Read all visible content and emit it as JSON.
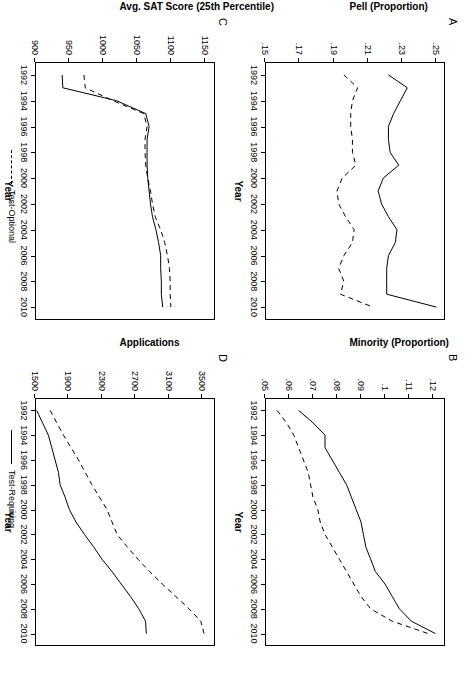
{
  "figure": {
    "panels": [
      "A",
      "B",
      "C",
      "D"
    ],
    "xlabel": "Year",
    "x_ticks": [
      "1992",
      "1994",
      "1996",
      "1998",
      "2000",
      "2002",
      "2004",
      "2006",
      "2008",
      "2010"
    ],
    "xlim": [
      1991,
      2011
    ],
    "legend": [
      {
        "label": "Test-Optional",
        "style": "dashed"
      },
      {
        "label": "Test-Requiring",
        "style": "solid"
      }
    ],
    "line_color": "#000000"
  },
  "chart_data": [
    {
      "type": "line",
      "panel": "A",
      "title": "A",
      "xlabel": "Year",
      "ylabel": "Pell (Proportion)",
      "xlim": [
        1991,
        2011
      ],
      "ylim": [
        0.15,
        0.255
      ],
      "y_ticks": [
        0.25,
        0.23,
        0.21,
        0.19,
        0.17,
        0.15
      ],
      "y_tick_labels": [
        ".25",
        ".23",
        ".21",
        ".19",
        ".17",
        ".15"
      ],
      "x": [
        1992,
        1993,
        1994,
        1995,
        1996,
        1997,
        1998,
        1999,
        2000,
        2001,
        2002,
        2003,
        2004,
        2005,
        2006,
        2007,
        2008,
        2009,
        2010
      ],
      "grid": false,
      "legend_position": "below-figure",
      "series": [
        {
          "name": "Test-Requiring",
          "style": "solid",
          "values": [
            0.222,
            0.233,
            0.229,
            0.225,
            0.222,
            0.222,
            0.223,
            0.228,
            0.219,
            0.216,
            0.218,
            0.222,
            0.227,
            0.226,
            0.222,
            0.221,
            0.221,
            0.221,
            0.25
          ]
        },
        {
          "name": "Test-Optional",
          "style": "dashed",
          "values": [
            0.196,
            0.204,
            0.201,
            0.2,
            0.2,
            0.201,
            0.201,
            0.203,
            0.195,
            0.192,
            0.193,
            0.197,
            0.202,
            0.201,
            0.196,
            0.193,
            0.196,
            0.194,
            0.213
          ]
        }
      ]
    },
    {
      "type": "line",
      "panel": "B",
      "title": "B",
      "xlabel": "Year",
      "ylabel": "Minority (Proportion)",
      "xlim": [
        1991,
        2011
      ],
      "ylim": [
        0.05,
        0.125
      ],
      "y_ticks": [
        0.12,
        0.11,
        0.1,
        0.09,
        0.08,
        0.07,
        0.06,
        0.05
      ],
      "y_tick_labels": [
        ".12",
        ".11",
        ".1",
        ".09",
        ".08",
        ".07",
        ".06",
        ".05"
      ],
      "x": [
        1992,
        1993,
        1994,
        1995,
        1996,
        1997,
        1998,
        1999,
        2000,
        2001,
        2002,
        2003,
        2004,
        2005,
        2006,
        2007,
        2008,
        2009,
        2010
      ],
      "grid": false,
      "legend_position": "below-figure",
      "series": [
        {
          "name": "Test-Requiring",
          "style": "solid",
          "values": [
            0.064,
            0.07,
            0.075,
            0.075,
            0.078,
            0.081,
            0.084,
            0.086,
            0.088,
            0.09,
            0.091,
            0.092,
            0.094,
            0.096,
            0.1,
            0.103,
            0.106,
            0.111,
            0.121
          ]
        },
        {
          "name": "Test-Optional",
          "style": "dashed",
          "values": [
            0.055,
            0.059,
            0.062,
            0.064,
            0.066,
            0.068,
            0.069,
            0.07,
            0.072,
            0.073,
            0.075,
            0.078,
            0.081,
            0.084,
            0.087,
            0.09,
            0.094,
            0.103,
            0.118
          ]
        }
      ]
    },
    {
      "type": "line",
      "panel": "C",
      "title": "C",
      "xlabel": "Year",
      "ylabel": "Avg. SAT Score (25th Percentile)",
      "xlim": [
        1991,
        2011
      ],
      "ylim": [
        900,
        1165
      ],
      "y_ticks": [
        1150,
        1100,
        1050,
        1000,
        950,
        900
      ],
      "y_tick_labels": [
        "1150",
        "1100",
        "1050",
        "1000",
        "950",
        "900"
      ],
      "x": [
        1992,
        1993,
        1994,
        1995,
        1996,
        1997,
        1998,
        1999,
        2000,
        2001,
        2002,
        2003,
        2004,
        2005,
        2006,
        2007,
        2008,
        2009,
        2010
      ],
      "grid": false,
      "legend_position": "below-figure",
      "series": [
        {
          "name": "Test-Requiring",
          "style": "solid",
          "values": [
            940,
            941,
            1020,
            1063,
            1068,
            1065,
            1065,
            1065,
            1066,
            1068,
            1070,
            1073,
            1078,
            1082,
            1085,
            1085,
            1086,
            1086,
            1088
          ]
        },
        {
          "name": "Test-Optional",
          "style": "dashed",
          "values": [
            972,
            974,
            1015,
            1060,
            1065,
            1062,
            1062,
            1063,
            1066,
            1070,
            1073,
            1077,
            1085,
            1091,
            1095,
            1098,
            1099,
            1099,
            1100
          ]
        }
      ]
    },
    {
      "type": "line",
      "panel": "D",
      "title": "D",
      "xlabel": "Year",
      "ylabel": "Applications",
      "xlim": [
        1991,
        2011
      ],
      "ylim": [
        1500,
        3650
      ],
      "y_ticks": [
        3500,
        3100,
        2700,
        2300,
        1900,
        1500
      ],
      "y_tick_labels": [
        "3500",
        "3100",
        "2700",
        "2300",
        "1900",
        "1500"
      ],
      "x": [
        1992,
        1993,
        1994,
        1995,
        1996,
        1997,
        1998,
        1999,
        2000,
        2001,
        2002,
        2003,
        2004,
        2005,
        2006,
        2007,
        2008,
        2009,
        2010
      ],
      "grid": false,
      "legend_position": "below-figure",
      "series": [
        {
          "name": "Test-Requiring",
          "style": "solid",
          "values": [
            1520,
            1590,
            1660,
            1700,
            1740,
            1780,
            1800,
            1860,
            1910,
            1990,
            2090,
            2200,
            2300,
            2420,
            2530,
            2640,
            2740,
            2820,
            2830
          ]
        },
        {
          "name": "Test-Optional",
          "style": "dashed",
          "values": [
            1680,
            1760,
            1840,
            1930,
            2020,
            2100,
            2180,
            2270,
            2360,
            2420,
            2480,
            2600,
            2730,
            2870,
            3020,
            3180,
            3340,
            3480,
            3520
          ]
        }
      ]
    }
  ]
}
